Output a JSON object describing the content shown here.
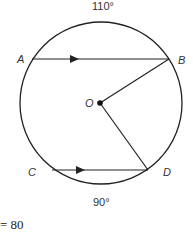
{
  "diagram": {
    "arc_top_label": "110°",
    "arc_bottom_label": "90°",
    "points": {
      "A": "A",
      "B": "B",
      "C": "C",
      "D": "D",
      "O": "O"
    },
    "footer_text": "= 80",
    "colors": {
      "stroke": "#222222",
      "background": "#ffffff"
    }
  }
}
